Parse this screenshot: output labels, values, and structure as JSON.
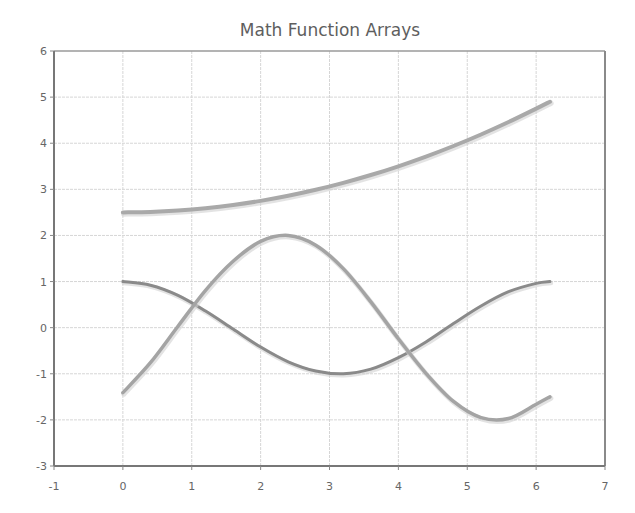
{
  "chart_data": {
    "type": "line",
    "title": "Math Function Arrays",
    "xlabel": "",
    "ylabel": "",
    "xlim": [
      -1,
      7
    ],
    "ylim": [
      -3,
      6
    ],
    "xticks": [
      -1,
      0,
      1,
      2,
      3,
      4,
      5,
      6,
      7
    ],
    "yticks": [
      -3,
      -2,
      -1,
      0,
      1,
      2,
      3,
      4,
      5,
      6
    ],
    "grid": true,
    "legend": null,
    "x": [
      0,
      0.4,
      0.8,
      1.2,
      1.6,
      2.0,
      2.4,
      2.8,
      3.2,
      3.6,
      4.0,
      4.4,
      4.8,
      5.2,
      5.6,
      6.0,
      6.2
    ],
    "series": [
      {
        "name": "quadratic",
        "color": "#a9a9a9",
        "width": 4,
        "values": [
          2.5,
          2.51,
          2.54,
          2.59,
          2.66,
          2.75,
          2.86,
          2.99,
          3.14,
          3.31,
          3.5,
          3.71,
          3.94,
          4.19,
          4.46,
          4.75,
          4.9
        ]
      },
      {
        "name": "cosine",
        "color": "#8a8a8a",
        "width": 3,
        "values": [
          1.0,
          0.92,
          0.7,
          0.36,
          -0.03,
          -0.42,
          -0.74,
          -0.94,
          -1.0,
          -0.9,
          -0.65,
          -0.31,
          0.09,
          0.47,
          0.78,
          0.96,
          1.0
        ]
      },
      {
        "name": "shifted-sine",
        "color": "#a4a4a4",
        "width": 3.5,
        "values": [
          -1.41,
          -0.76,
          0.03,
          0.81,
          1.44,
          1.87,
          2.0,
          1.79,
          1.28,
          0.56,
          -0.24,
          -0.99,
          -1.6,
          -1.95,
          -1.97,
          -1.66,
          -1.5
        ]
      }
    ]
  }
}
